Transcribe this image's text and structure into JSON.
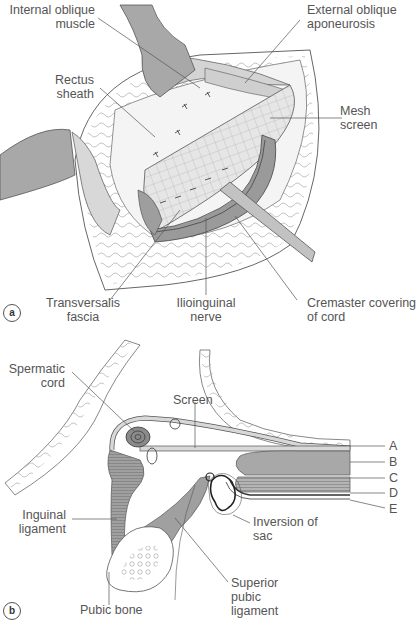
{
  "figure": {
    "colors": {
      "muscle": "#a6a6a6",
      "light_tissue": "#d9d9d9",
      "mesh": "#e3e3e3",
      "cord_dark": "#8a8a8a",
      "outline": "#4a4a4a",
      "leader": "#555555",
      "text": "#555555"
    },
    "panel_a": {
      "badge": "a",
      "labels": {
        "internal_oblique": [
          "Internal oblique",
          "muscle"
        ],
        "external_oblique": [
          "External oblique",
          "aponeurosis"
        ],
        "rectus_sheath": [
          "Rectus",
          "sheath"
        ],
        "mesh_screen": [
          "Mesh",
          "screen"
        ],
        "transversalis": [
          "Transversalis",
          "fascia"
        ],
        "ilioinguinal": [
          "Ilioinguinal",
          "nerve"
        ],
        "cremaster": [
          "Cremaster covering",
          "of cord"
        ]
      }
    },
    "panel_b": {
      "badge": "b",
      "labels": {
        "spermatic_cord": [
          "Spermatic",
          "cord"
        ],
        "screen": "Screen",
        "inguinal_ligament": [
          "Inguinal",
          "ligament"
        ],
        "inversion_of_sac": [
          "Inversion of",
          "sac"
        ],
        "superior_pubic_ligament": [
          "Superior",
          "pubic",
          "ligament"
        ],
        "pubic_bone": "Pubic bone"
      },
      "layer_keys": [
        "A",
        "B",
        "C",
        "D",
        "E"
      ]
    }
  }
}
